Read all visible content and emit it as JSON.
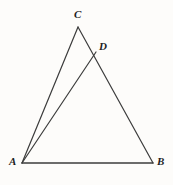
{
  "figure": {
    "type": "geometry-diagram",
    "background_color": "#fdfcfa",
    "stroke_color": "#3c3c3c",
    "label_color": "#1e1e1e",
    "width": 173,
    "height": 185,
    "points": {
      "A": {
        "label": "A",
        "x": 22,
        "y": 163
      },
      "B": {
        "label": "B",
        "x": 153,
        "y": 163
      },
      "C": {
        "label": "C",
        "x": 78,
        "y": 27
      },
      "D": {
        "label": "D",
        "x": 96,
        "y": 52
      }
    },
    "segments": [
      {
        "name": "segment-AC",
        "from": "A",
        "to": "C"
      },
      {
        "name": "segment-CB",
        "from": "C",
        "to": "B"
      },
      {
        "name": "segment-AB",
        "from": "A",
        "to": "B"
      },
      {
        "name": "segment-AD",
        "from": "A",
        "to": "D"
      }
    ]
  }
}
